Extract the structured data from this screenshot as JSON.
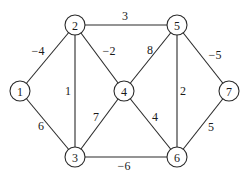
{
  "graph": {
    "nodes": [
      {
        "id": "1",
        "label": "1",
        "x": 20,
        "y": 91
      },
      {
        "id": "2",
        "label": "2",
        "x": 75,
        "y": 25
      },
      {
        "id": "3",
        "label": "3",
        "x": 75,
        "y": 157
      },
      {
        "id": "4",
        "label": "4",
        "x": 124,
        "y": 91
      },
      {
        "id": "5",
        "label": "5",
        "x": 177,
        "y": 25
      },
      {
        "id": "6",
        "label": "6",
        "x": 177,
        "y": 157
      },
      {
        "id": "7",
        "label": "7",
        "x": 229,
        "y": 91
      }
    ],
    "edges": [
      {
        "from": "1",
        "to": "2",
        "weight": "−4",
        "lx": 38,
        "ly": 51
      },
      {
        "from": "1",
        "to": "3",
        "weight": "6",
        "lx": 41,
        "ly": 126
      },
      {
        "from": "2",
        "to": "5",
        "weight": "3",
        "lx": 125,
        "ly": 16
      },
      {
        "from": "2",
        "to": "3",
        "weight": "1",
        "lx": 68,
        "ly": 91
      },
      {
        "from": "2",
        "to": "4",
        "weight": "−2",
        "lx": 109,
        "ly": 51
      },
      {
        "from": "3",
        "to": "4",
        "weight": "7",
        "lx": 96,
        "ly": 117
      },
      {
        "from": "3",
        "to": "6",
        "weight": "−6",
        "lx": 124,
        "ly": 166
      },
      {
        "from": "4",
        "to": "5",
        "weight": "8",
        "lx": 150,
        "ly": 50
      },
      {
        "from": "4",
        "to": "6",
        "weight": "4",
        "lx": 155,
        "ly": 117
      },
      {
        "from": "5",
        "to": "6",
        "weight": "2",
        "lx": 183,
        "ly": 91
      },
      {
        "from": "5",
        "to": "7",
        "weight": "−5",
        "lx": 215,
        "ly": 55
      },
      {
        "from": "6",
        "to": "7",
        "weight": "5",
        "lx": 211,
        "ly": 127
      }
    ]
  }
}
